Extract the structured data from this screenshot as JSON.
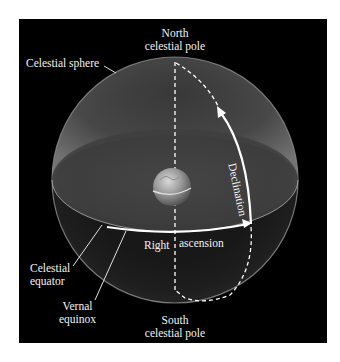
{
  "figure": {
    "background_color": "#000000",
    "line_color": "#ffffff"
  },
  "labels": {
    "north_pole_line1": "North",
    "north_pole_line2": "celestial pole",
    "celestial_sphere": "Celestial sphere",
    "declination": "Declination",
    "right_ascension_part1": "Right",
    "right_ascension_part2": "ascension",
    "celestial_equator_line1": "Celestial",
    "celestial_equator_line2": "equator",
    "vernal_equinox_line1": "Vernal",
    "vernal_equinox_line2": "equinox",
    "south_pole_line1": "South",
    "south_pole_line2": "celestial pole"
  }
}
